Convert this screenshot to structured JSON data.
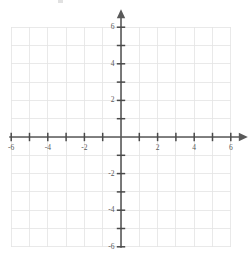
{
  "figure": {
    "title": "",
    "kind": "cartesian-coordinate-grid"
  },
  "colors": {
    "grid": "#e3e3e3",
    "axis": "#595959",
    "tick": "#4a4a4a",
    "label": "#585858",
    "background": "#ffffff"
  },
  "chart_data": {
    "type": "scatter",
    "title": "",
    "subtitle": "",
    "xlabel": "",
    "ylabel": "",
    "xlim": [
      -6,
      6
    ],
    "ylim": [
      -6,
      6
    ],
    "x_ticks": [
      -6,
      -5,
      -4,
      -3,
      -2,
      -1,
      0,
      1,
      2,
      3,
      4,
      5,
      6
    ],
    "y_ticks": [
      -6,
      -5,
      -4,
      -3,
      -2,
      -1,
      0,
      1,
      2,
      3,
      4,
      5,
      6
    ],
    "x_tick_labels": [
      "-6",
      "-4",
      "-2",
      "2",
      "4",
      "6"
    ],
    "y_tick_labels": [
      "6",
      "4",
      "2",
      "-2",
      "-4",
      "-6"
    ],
    "labeled_x_values": [
      -6,
      -4,
      -2,
      2,
      4,
      6
    ],
    "labeled_y_values": [
      6,
      4,
      2,
      -2,
      -4,
      -6
    ],
    "grid": true,
    "grid_step": 1,
    "legend": null,
    "legend_position": "none",
    "series": [],
    "annotations": [],
    "x_axis_arrow": "right",
    "y_axis_arrow": "up",
    "origin_label": ""
  },
  "labels": {
    "x": [
      {
        "text": "-6",
        "value": -6
      },
      {
        "text": "-4",
        "value": -4
      },
      {
        "text": "-2",
        "value": -2
      },
      {
        "text": "2",
        "value": 2
      },
      {
        "text": "4",
        "value": 4
      },
      {
        "text": "6",
        "value": 6
      }
    ],
    "y": [
      {
        "text": "6",
        "value": 6
      },
      {
        "text": "4",
        "value": 4
      },
      {
        "text": "2",
        "value": 2
      },
      {
        "text": "-2",
        "value": -2
      },
      {
        "text": "-4",
        "value": -4
      },
      {
        "text": "-6",
        "value": -6
      }
    ]
  },
  "geometry": {
    "origin_x": 121,
    "origin_y": 137,
    "unit_px": 18.3,
    "width": 252,
    "height": 264
  }
}
